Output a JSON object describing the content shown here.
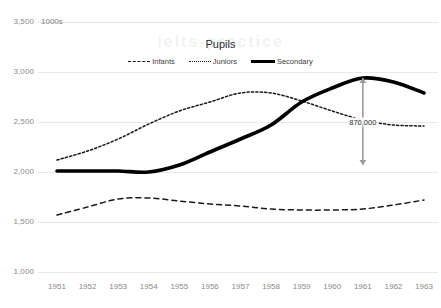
{
  "chart_data": {
    "type": "line",
    "title": "Pupils",
    "xlabel": "",
    "ylabel": "1000s",
    "units_label": "1000s",
    "x": [
      1951,
      1952,
      1953,
      1954,
      1955,
      1956,
      1957,
      1958,
      1959,
      1960,
      1961,
      1962,
      1963
    ],
    "categories": [
      "1951",
      "1952",
      "1953",
      "1954",
      "1955",
      "1956",
      "1957",
      "1958",
      "1959",
      "1960",
      "1961",
      "1962",
      "1963"
    ],
    "ylim": [
      1000,
      3500
    ],
    "yticks": [
      3500,
      3000,
      2500,
      2000,
      1500,
      1000
    ],
    "ytick_labels": [
      "3,500",
      "3,000",
      "2,500",
      "2,000",
      "1,500",
      "1,000"
    ],
    "grid": true,
    "legend_position": "top-center",
    "series": [
      {
        "name": "Infants",
        "style": "dashed",
        "color": "#1a1a1a",
        "values": [
          1570,
          1650,
          1730,
          1740,
          1710,
          1680,
          1660,
          1630,
          1620,
          1620,
          1630,
          1670,
          1720
        ]
      },
      {
        "name": "Juniors",
        "style": "dotted",
        "color": "#1a1a1a",
        "values": [
          2120,
          2210,
          2330,
          2480,
          2610,
          2700,
          2790,
          2790,
          2710,
          2610,
          2520,
          2470,
          2460
        ]
      },
      {
        "name": "Secondary",
        "style": "solid-thick",
        "color": "#000000",
        "values": [
          2010,
          2010,
          2010,
          2000,
          2070,
          2200,
          2330,
          2470,
          2700,
          2840,
          2940,
          2900,
          2790
        ]
      }
    ],
    "annotations": [
      {
        "label": "870,000",
        "at_x": 1961,
        "from_value": 2940,
        "to_value": 2070,
        "arrow": "double",
        "color": "#9a9a9a"
      }
    ],
    "watermark": "ielts-practice"
  }
}
